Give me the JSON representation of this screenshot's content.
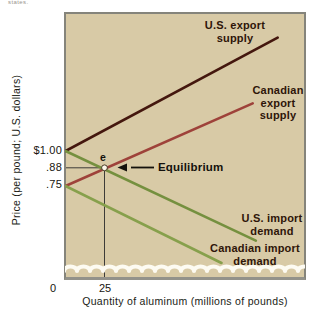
{
  "page": {
    "top_text": "states."
  },
  "axes": {
    "y_title": "Price (per pound; U.S. dollars)",
    "x_title": "Quantity of aluminum (millions of pounds)",
    "y_tick_labels": [
      "$1.00",
      ".88",
      ".75"
    ],
    "x_tick_labels": [
      "0",
      "25"
    ]
  },
  "annotations": {
    "equilibrium_label": "Equilibrium",
    "equilibrium_point_label": "e"
  },
  "curve_labels": {
    "us_export": "U.S. export supply",
    "ca_export": "Canadian export supply",
    "us_import": "U.S. import demand",
    "ca_import": "Canadian import demand"
  },
  "colors": {
    "plot_bg": "#d8caa6",
    "plot_border": "#85847b",
    "us_export": "#44170e",
    "ca_export": "#9e423a",
    "us_import": "#75903f",
    "ca_import": "#87a04c",
    "guide_line": "#2b2b2b",
    "equilibrium_dot_fill": "#fbf7ea",
    "equilibrium_dot_ring": "#3a2c18",
    "arrow": "#14110c",
    "wave": "#fdfbf2"
  },
  "chart_data": {
    "type": "line",
    "title": "",
    "xlabel": "Quantity of aluminum (millions of pounds)",
    "ylabel": "Price (per pound; U.S. dollars)",
    "x_ticks": [
      0,
      25
    ],
    "y_ticks": [
      1.0,
      0.88,
      0.75
    ],
    "xlim": [
      0,
      150
    ],
    "ylim": [
      0.15,
      1.85
    ],
    "grid": false,
    "legend": "labels-on-chart",
    "equilibrium": {
      "quantity": 25,
      "price": 0.88,
      "point_label": "e",
      "annotation": "Equilibrium"
    },
    "series": [
      {
        "name": "U.S. export supply",
        "role": "export-supply",
        "color": "#44170e",
        "points": [
          [
            0,
            1.0
          ],
          [
            136,
            1.81
          ]
        ]
      },
      {
        "name": "Canadian export supply",
        "role": "export-supply",
        "color": "#9e423a",
        "points": [
          [
            0,
            0.75
          ],
          [
            120,
            1.34
          ]
        ]
      },
      {
        "name": "U.S. import demand",
        "role": "import-demand",
        "color": "#75903f",
        "points": [
          [
            0,
            1.0
          ],
          [
            122,
            0.36
          ]
        ]
      },
      {
        "name": "Canadian import demand",
        "role": "import-demand",
        "color": "#87a04c",
        "points": [
          [
            0,
            0.75
          ],
          [
            100,
            0.2
          ]
        ]
      }
    ]
  }
}
